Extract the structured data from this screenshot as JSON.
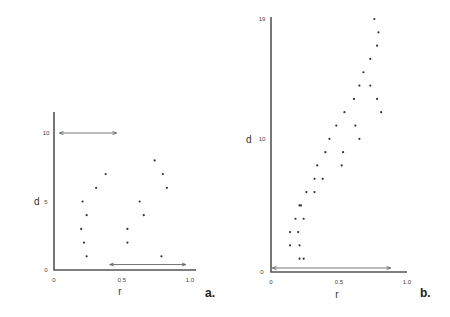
{
  "chart_data": [
    {
      "type": "scatter",
      "panel_label": "a.",
      "xlabel": "r",
      "ylabel": "d",
      "xlim": [
        0,
        1.0
      ],
      "ylim": [
        0,
        10
      ],
      "x_ticks": [
        "0",
        "0.5",
        "1.0"
      ],
      "y_ticks": [
        "0",
        "5",
        "10"
      ],
      "grid": false,
      "points": [
        {
          "r": 0.21,
          "d": 5
        },
        {
          "r": 0.24,
          "d": 4
        },
        {
          "r": 0.2,
          "d": 3
        },
        {
          "r": 0.22,
          "d": 2
        },
        {
          "r": 0.24,
          "d": 1
        },
        {
          "r": 0.31,
          "d": 6
        },
        {
          "r": 0.38,
          "d": 7
        },
        {
          "r": 0.63,
          "d": 5
        },
        {
          "r": 0.66,
          "d": 4
        },
        {
          "r": 0.54,
          "d": 3
        },
        {
          "r": 0.54,
          "d": 2
        },
        {
          "r": 0.74,
          "d": 8
        },
        {
          "r": 0.8,
          "d": 7
        },
        {
          "r": 0.83,
          "d": 6
        },
        {
          "r": 0.79,
          "d": 1
        }
      ],
      "arrows": [
        {
          "r1": 0.04,
          "r2": 0.46,
          "d": 10
        },
        {
          "r1": 0.41,
          "r2": 0.97,
          "d": 0.4
        }
      ]
    },
    {
      "type": "scatter",
      "panel_label": "b.",
      "xlabel": "r",
      "ylabel": "d",
      "xlim": [
        0,
        1.0
      ],
      "ylim": [
        0,
        19
      ],
      "x_ticks": [
        "0",
        "0.5",
        "1.0"
      ],
      "y_ticks": [
        "0",
        "10",
        "19"
      ],
      "grid": false,
      "points": [
        {
          "r": 0.21,
          "d": 1
        },
        {
          "r": 0.24,
          "d": 1
        },
        {
          "r": 0.14,
          "d": 2
        },
        {
          "r": 0.21,
          "d": 2
        },
        {
          "r": 0.14,
          "d": 3
        },
        {
          "r": 0.2,
          "d": 3
        },
        {
          "r": 0.18,
          "d": 4
        },
        {
          "r": 0.24,
          "d": 4
        },
        {
          "r": 0.21,
          "d": 5
        },
        {
          "r": 0.22,
          "d": 5
        },
        {
          "r": 0.26,
          "d": 6
        },
        {
          "r": 0.32,
          "d": 6
        },
        {
          "r": 0.32,
          "d": 7
        },
        {
          "r": 0.38,
          "d": 7
        },
        {
          "r": 0.34,
          "d": 8
        },
        {
          "r": 0.52,
          "d": 8
        },
        {
          "r": 0.4,
          "d": 9
        },
        {
          "r": 0.53,
          "d": 9
        },
        {
          "r": 0.43,
          "d": 10
        },
        {
          "r": 0.65,
          "d": 10
        },
        {
          "r": 0.48,
          "d": 11
        },
        {
          "r": 0.62,
          "d": 11
        },
        {
          "r": 0.54,
          "d": 12
        },
        {
          "r": 0.81,
          "d": 12
        },
        {
          "r": 0.61,
          "d": 13
        },
        {
          "r": 0.78,
          "d": 13
        },
        {
          "r": 0.65,
          "d": 14
        },
        {
          "r": 0.73,
          "d": 14
        },
        {
          "r": 0.68,
          "d": 15
        },
        {
          "r": 0.73,
          "d": 16
        },
        {
          "r": 0.78,
          "d": 17
        },
        {
          "r": 0.79,
          "d": 18
        },
        {
          "r": 0.76,
          "d": 19
        }
      ],
      "arrows": [
        {
          "r1": 0.01,
          "r2": 0.88,
          "d": 0.3
        }
      ]
    }
  ]
}
